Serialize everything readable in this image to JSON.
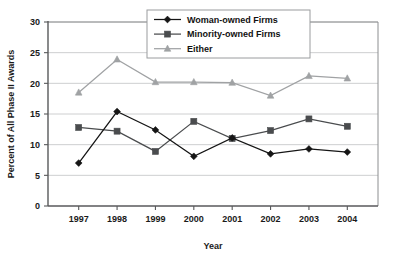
{
  "chart_data": {
    "type": "line",
    "title": "",
    "xlabel": "Year",
    "ylabel": "Percent of All Phase II Awards",
    "categories": [
      "1997",
      "1998",
      "1999",
      "2000",
      "2001",
      "2002",
      "2003",
      "2004"
    ],
    "xlim": [
      1996.5,
      2004.5
    ],
    "ylim": [
      0,
      30
    ],
    "yticks": [
      "0",
      "5",
      "10",
      "15",
      "20",
      "25",
      "30"
    ],
    "ytick_values": [
      0,
      5,
      10,
      15,
      20,
      25,
      30
    ],
    "grid": "horizontal",
    "legend_position": "top-center",
    "series": [
      {
        "name": "Woman-owned Firms",
        "marker": "diamond",
        "color": "#151515",
        "values": [
          7.0,
          15.4,
          12.4,
          8.1,
          11.1,
          8.5,
          9.3,
          8.8
        ]
      },
      {
        "name": "Minority-owned Firms",
        "marker": "square",
        "color": "#4a4c4e",
        "values": [
          12.8,
          12.2,
          8.9,
          13.8,
          11.0,
          12.3,
          14.2,
          13.0
        ]
      },
      {
        "name": "Either",
        "marker": "triangle",
        "color": "#a0a2a4",
        "values": [
          18.5,
          23.9,
          20.2,
          20.2,
          20.1,
          18.0,
          21.2,
          20.8
        ]
      }
    ]
  }
}
